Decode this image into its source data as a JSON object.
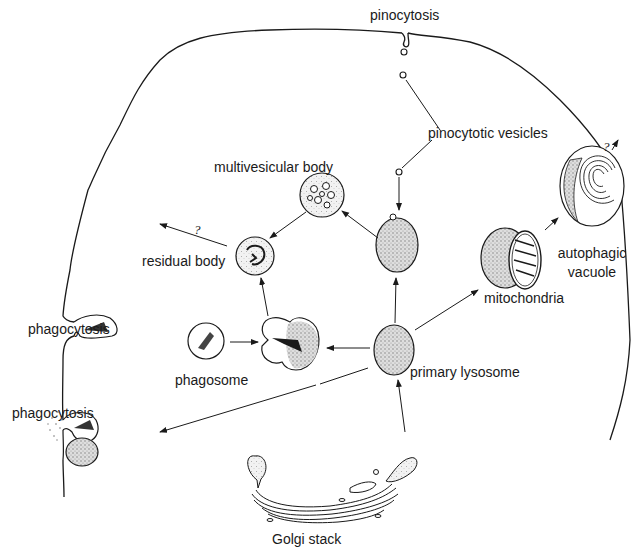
{
  "labels": {
    "pinocytosis": "pinocytosis",
    "pinocytotic_vesicles": "pinocytotic vesicles",
    "multivesicular_body": "multivesicular body",
    "residual_body": "residual body",
    "phagocytosis_top": "phagocytosis",
    "phagosome": "phagosome",
    "phagocytosis_bottom": "phagocytosis",
    "primary_lysosome": "primary lysosome",
    "mitochondria": "mitochondria",
    "autophagic_vacuole_line1": "autophagic",
    "autophagic_vacuole_line2": "vacuole",
    "golgi_stack": "Golgi stack",
    "unknown_fate_residual": "?",
    "unknown_fate_autophagic": "?"
  },
  "colors": {
    "ink": "#1a1a1a",
    "stipple_fill": "#cfcfcf",
    "background": "#ffffff"
  }
}
